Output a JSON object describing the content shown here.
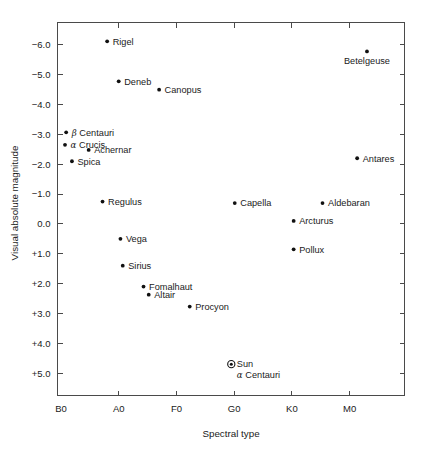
{
  "chart_data": {
    "type": "scatter",
    "title": "",
    "xlabel": "Spectral type",
    "ylabel": "Visual absolute magnitude",
    "grid": false,
    "legend": "none",
    "x_tick_labels": [
      "B0",
      "A0",
      "F0",
      "G0",
      "K0",
      "M0"
    ],
    "x_tick_values": [
      0,
      1,
      2,
      3,
      4,
      5
    ],
    "xlim": [
      -0.06,
      5.95
    ],
    "y_tick_labels": [
      "-6.0",
      "-5.0",
      "-4.0",
      "-3.0",
      "-2.0",
      "-1.0",
      "0.0",
      "+1.0",
      "+2.0",
      "+3.0",
      "+4.0",
      "+5.0"
    ],
    "y_tick_values": [
      -6.0,
      -5.0,
      -4.0,
      -3.0,
      -2.0,
      -1.0,
      0.0,
      1.0,
      2.0,
      3.0,
      4.0,
      5.0
    ],
    "ylim": [
      5.75,
      -6.75
    ],
    "y_axis_inverted": true,
    "points": [
      {
        "name": "Rigel",
        "x": 0.8,
        "y": -6.12,
        "label": "Rigel",
        "label_pos": "right",
        "marker": "dot"
      },
      {
        "name": "Betelgeuse",
        "x": 5.3,
        "y": -5.78,
        "label": "Betelgeuse",
        "label_pos": "below",
        "marker": "dot"
      },
      {
        "name": "Deneb",
        "x": 1.0,
        "y": -4.78,
        "label": "Deneb",
        "label_pos": "right",
        "marker": "dot"
      },
      {
        "name": "Canopus",
        "x": 1.7,
        "y": -4.5,
        "label": "Canopus",
        "label_pos": "right",
        "marker": "dot"
      },
      {
        "name": "beta Centauri",
        "x": 0.09,
        "y": -3.07,
        "label": "Centauri",
        "greek": "β",
        "label_pos": "right",
        "marker": "dot"
      },
      {
        "name": "alpha Crucis",
        "x": 0.07,
        "y": -2.65,
        "label": "Crucis",
        "greek": "α",
        "label_pos": "right",
        "marker": "dot"
      },
      {
        "name": "Achernar",
        "x": 0.48,
        "y": -2.48,
        "label": "Achernar",
        "label_pos": "right",
        "marker": "dot"
      },
      {
        "name": "Spica",
        "x": 0.19,
        "y": -2.1,
        "label": "Spica",
        "label_pos": "right",
        "marker": "dot"
      },
      {
        "name": "Antares",
        "x": 5.13,
        "y": -2.2,
        "label": "Antares",
        "label_pos": "right",
        "marker": "dot"
      },
      {
        "name": "Regulus",
        "x": 0.72,
        "y": -0.75,
        "label": "Regulus",
        "label_pos": "right",
        "marker": "dot"
      },
      {
        "name": "Capella",
        "x": 3.01,
        "y": -0.7,
        "label": "Capella",
        "label_pos": "right",
        "marker": "dot"
      },
      {
        "name": "Aldebaran",
        "x": 4.53,
        "y": -0.7,
        "label": "Aldebaran",
        "label_pos": "right",
        "marker": "dot"
      },
      {
        "name": "Arcturus",
        "x": 4.03,
        "y": -0.1,
        "label": "Arcturus",
        "label_pos": "right",
        "marker": "dot"
      },
      {
        "name": "Vega",
        "x": 1.03,
        "y": 0.5,
        "label": "Vega",
        "label_pos": "right",
        "marker": "dot"
      },
      {
        "name": "Pollux",
        "x": 4.03,
        "y": 0.85,
        "label": "Pollux",
        "label_pos": "right",
        "marker": "dot"
      },
      {
        "name": "Sirius",
        "x": 1.07,
        "y": 1.4,
        "label": "Sirius",
        "label_pos": "right",
        "marker": "dot"
      },
      {
        "name": "Fomalhaut",
        "x": 1.43,
        "y": 2.1,
        "label": "Fomalhaut",
        "label_pos": "right",
        "marker": "dot"
      },
      {
        "name": "Altair",
        "x": 1.52,
        "y": 2.37,
        "label": "Altair",
        "label_pos": "right",
        "marker": "dot"
      },
      {
        "name": "Procyon",
        "x": 2.23,
        "y": 2.77,
        "label": "Procyon",
        "label_pos": "right",
        "marker": "dot"
      },
      {
        "name": "Sun",
        "x": 2.95,
        "y": 4.7,
        "label": "Sun",
        "label2": "Centauri",
        "greek2": "α",
        "label_pos": "right",
        "marker": "sun"
      }
    ]
  }
}
